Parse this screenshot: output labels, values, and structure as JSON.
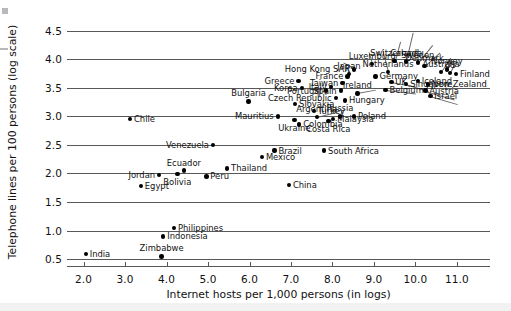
{
  "chart_data": {
    "type": "scatter",
    "title": "",
    "xlabel": "Internet hosts per 1,000 persons (in logs)",
    "ylabel": "Telephone lines per 100 persons (log scale)",
    "xlim": [
      1.6,
      11.8
    ],
    "ylim": [
      0.38,
      4.72
    ],
    "xticks": [
      "2.0",
      "3.0",
      "4.0",
      "5.0",
      "6.0",
      "7.0",
      "8.0",
      "9.0",
      "10.0",
      "11.0"
    ],
    "xtick_values": [
      2.0,
      3.0,
      4.0,
      5.0,
      6.0,
      7.0,
      8.0,
      9.0,
      10.0,
      11.0
    ],
    "yticks": [
      "0.5",
      "1.0",
      "1.5",
      "2.0",
      "2.5",
      "3.0",
      "3.5",
      "4.0",
      "4.5"
    ],
    "ytick_values": [
      0.5,
      1.0,
      1.5,
      2.0,
      2.5,
      3.0,
      3.5,
      4.0,
      4.5
    ],
    "grid": "horizontal",
    "legend": "none",
    "points": [
      {
        "label": "India",
        "x": 2.05,
        "y": 0.59,
        "lpos": "r"
      },
      {
        "label": "Zimbabwe",
        "x": 3.88,
        "y": 0.55,
        "lpos": "above"
      },
      {
        "label": "Indonesia",
        "x": 3.92,
        "y": 0.9,
        "lpos": "r"
      },
      {
        "label": "Philippines",
        "x": 4.18,
        "y": 1.05,
        "lpos": "r"
      },
      {
        "label": "Egypt",
        "x": 3.38,
        "y": 1.78,
        "lpos": "r"
      },
      {
        "label": "Jordan",
        "x": 3.82,
        "y": 1.97,
        "lpos": "l"
      },
      {
        "label": "Bolivia",
        "x": 4.26,
        "y": 1.99,
        "lpos": "below"
      },
      {
        "label": "Ecuador",
        "x": 4.42,
        "y": 2.05,
        "lpos": "above"
      },
      {
        "label": "Peru",
        "x": 4.96,
        "y": 1.95,
        "lpos": "r"
      },
      {
        "label": "Thailand",
        "x": 5.46,
        "y": 2.09,
        "lpos": "r"
      },
      {
        "label": "China",
        "x": 6.95,
        "y": 1.8,
        "lpos": "r"
      },
      {
        "label": "Mexico",
        "x": 6.3,
        "y": 2.29,
        "lpos": "r"
      },
      {
        "label": "Brazil",
        "x": 6.6,
        "y": 2.4,
        "lpos": "r"
      },
      {
        "label": "South Africa",
        "x": 7.8,
        "y": 2.4,
        "lpos": "r"
      },
      {
        "label": "Venezuela",
        "x": 5.12,
        "y": 2.5,
        "lpos": "l"
      },
      {
        "label": "Chile",
        "x": 3.12,
        "y": 2.95,
        "lpos": "r"
      },
      {
        "label": "Mauritius",
        "x": 6.68,
        "y": 3.0,
        "lpos": "l"
      },
      {
        "label": "Ukraine",
        "x": 7.08,
        "y": 2.94,
        "lpos": "below"
      },
      {
        "label": "Colombia",
        "x": 7.2,
        "y": 2.86,
        "lpos": "r"
      },
      {
        "label": "Argentina",
        "x": 7.62,
        "y": 2.99,
        "lpos": "above"
      },
      {
        "label": "Turkey",
        "x": 7.55,
        "y": 3.09,
        "lpos": "r"
      },
      {
        "label": "Costa Rica",
        "x": 7.9,
        "y": 2.92,
        "lpos": "below"
      },
      {
        "label": "Malaysia",
        "x": 8.02,
        "y": 2.95,
        "lpos": "r"
      },
      {
        "label": "Russia",
        "x": 8.18,
        "y": 3.0,
        "lpos": "above"
      },
      {
        "label": "Poland",
        "x": 8.52,
        "y": 3.0,
        "lpos": "r"
      },
      {
        "label": "Bulgaria",
        "x": 5.98,
        "y": 3.26,
        "lpos": "above"
      },
      {
        "label": "Slovakia",
        "x": 7.1,
        "y": 3.22,
        "lpos": "r"
      },
      {
        "label": "Czech Republic",
        "x": 8.08,
        "y": 3.32,
        "lpos": "l"
      },
      {
        "label": "Hungary",
        "x": 8.3,
        "y": 3.28,
        "lpos": "r"
      },
      {
        "label": "Greece",
        "x": 7.18,
        "y": 3.62,
        "lpos": "l"
      },
      {
        "label": "Korea",
        "x": 7.26,
        "y": 3.5,
        "lpos": "l"
      },
      {
        "label": "Portugal",
        "x": 7.84,
        "y": 3.45,
        "lpos": "l"
      },
      {
        "label": "Italy",
        "x": 7.96,
        "y": 3.51,
        "lpos": "l"
      },
      {
        "label": "Spain",
        "x": 8.2,
        "y": 3.45,
        "lpos": "l"
      },
      {
        "label": "Taiwan",
        "x": 8.24,
        "y": 3.58,
        "lpos": "l"
      },
      {
        "label": "Japan",
        "x": 8.4,
        "y": 3.74,
        "lpos": "above"
      },
      {
        "label": "France",
        "x": 8.36,
        "y": 3.7,
        "lpos": "l"
      },
      {
        "label": "Hong Kong SAR",
        "x": 8.52,
        "y": 3.82,
        "lpos": "l"
      },
      {
        "label": "Ireland",
        "x": 8.6,
        "y": 3.4,
        "lpos": "above"
      },
      {
        "label": "Luxemburg",
        "x": 8.96,
        "y": 3.92,
        "lpos": "above"
      },
      {
        "label": "Germany",
        "x": 9.04,
        "y": 3.7,
        "lpos": "r"
      },
      {
        "label": "Netherlands",
        "x": 9.34,
        "y": 3.78,
        "lpos": "above"
      },
      {
        "label": "Switzerland",
        "x": 9.5,
        "y": 3.97,
        "lpos": "above"
      },
      {
        "label": "UK",
        "x": 9.42,
        "y": 3.6,
        "lpos": "r"
      },
      {
        "label": "Belgium",
        "x": 9.28,
        "y": 3.46,
        "lpos": "r"
      },
      {
        "label": "Canada",
        "x": 9.78,
        "y": 3.96,
        "lpos": "above"
      },
      {
        "label": "Sweden",
        "x": 10.06,
        "y": 3.94,
        "lpos": "above"
      },
      {
        "label": "Denmark",
        "x": 10.22,
        "y": 3.88,
        "lpos": "above"
      },
      {
        "label": "Singapore",
        "x": 9.78,
        "y": 3.57,
        "lpos": "r"
      },
      {
        "label": "Iceland",
        "x": 10.06,
        "y": 3.62,
        "lpos": "r"
      },
      {
        "label": "New Zealand",
        "x": 10.3,
        "y": 3.56,
        "lpos": "r"
      },
      {
        "label": "Austria",
        "x": 10.24,
        "y": 3.45,
        "lpos": "r"
      },
      {
        "label": "Israel",
        "x": 10.36,
        "y": 3.36,
        "lpos": "r"
      },
      {
        "label": "Australia",
        "x": 10.62,
        "y": 3.78,
        "lpos": "above"
      },
      {
        "label": "Norway",
        "x": 10.76,
        "y": 3.82,
        "lpos": "above"
      },
      {
        "label": "US",
        "x": 10.84,
        "y": 3.76,
        "lpos": "above"
      },
      {
        "label": "Finland",
        "x": 10.98,
        "y": 3.74,
        "lpos": "r"
      }
    ]
  }
}
